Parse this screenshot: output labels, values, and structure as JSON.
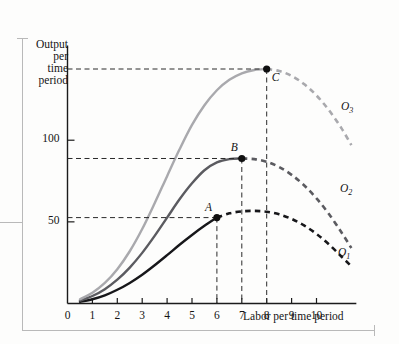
{
  "figure": {
    "y_axis_title_lines": [
      "Output",
      "per",
      "time",
      "period"
    ],
    "x_axis_title": "Labor per time period"
  },
  "chart_data": {
    "type": "line",
    "title": "",
    "xlabel": "Labor per time period",
    "ylabel": "Output per time period",
    "xlim": [
      0,
      11.6
    ],
    "ylim": [
      0,
      158
    ],
    "grid": false,
    "x_ticks": [
      0,
      1,
      2,
      3,
      4,
      5,
      6,
      7,
      8,
      9,
      10
    ],
    "x_tick_labels": [
      "0",
      "1",
      "2",
      "3",
      "4",
      "5",
      "6",
      "7",
      "8",
      "9",
      "10"
    ],
    "y_ticks": [
      50,
      100
    ],
    "y_tick_labels": [
      "50",
      "100"
    ],
    "series": [
      {
        "name": "O1",
        "label": "O₁",
        "color": "#17171a",
        "x": [
          0,
          0.5,
          1,
          1.5,
          2,
          2.5,
          3,
          3.5,
          4,
          4.5,
          5,
          5.5,
          6,
          6.5,
          7,
          7.5,
          8,
          8.5,
          9,
          9.5,
          10,
          10.5,
          11,
          11.4
        ],
        "values": [
          0,
          1.0,
          2.6,
          5.0,
          8.4,
          12.6,
          17.6,
          23.4,
          29.6,
          36.0,
          42.0,
          47.6,
          52.6,
          55.2,
          56.4,
          56.7,
          56.2,
          54.6,
          51.8,
          47.8,
          42.6,
          36.2,
          28.8,
          22.8
        ],
        "solid_until_x": 6,
        "dashed_after_x": 6
      },
      {
        "name": "O2",
        "label": "O₂",
        "color": "#5b5b60",
        "x": [
          0,
          0.5,
          1,
          1.5,
          2,
          2.5,
          3,
          3.5,
          4,
          4.5,
          5,
          5.5,
          6,
          6.5,
          7,
          7.5,
          8,
          8.5,
          9,
          9.5,
          10,
          10.5,
          11,
          11.4
        ],
        "values": [
          0,
          1.8,
          4.6,
          8.8,
          14.6,
          22.0,
          31.0,
          41.4,
          52.6,
          63.8,
          73.6,
          81.6,
          86.4,
          88.4,
          88.8,
          88.4,
          86.8,
          83.6,
          78.8,
          72.4,
          64.4,
          54.8,
          43.6,
          34.0
        ],
        "solid_until_x": 7,
        "dashed_after_x": 7
      },
      {
        "name": "O3",
        "label": "O₃",
        "color": "#a9a9ad",
        "x": [
          0,
          0.5,
          1,
          1.5,
          2,
          2.5,
          3,
          3.5,
          4,
          4.5,
          5,
          5.5,
          6,
          6.5,
          7,
          7.5,
          8,
          8.5,
          9,
          9.5,
          10,
          10.5,
          11,
          11.4
        ],
        "values": [
          0,
          2.6,
          6.6,
          12.6,
          21.0,
          32.0,
          45.6,
          61.4,
          78.0,
          94.4,
          109.4,
          121.4,
          130.6,
          137.0,
          141.0,
          143.0,
          143.6,
          142.4,
          139.4,
          134.4,
          127.4,
          118.4,
          107.4,
          97.0
        ],
        "solid_until_x": 8,
        "dashed_after_x": 8
      }
    ],
    "points": [
      {
        "label": "A",
        "x": 6,
        "y": 52.6,
        "series": "O1"
      },
      {
        "label": "B",
        "x": 7,
        "y": 88.8,
        "series": "O2"
      },
      {
        "label": "C",
        "x": 8,
        "y": 143.6,
        "series": "O3"
      }
    ],
    "annotations": {
      "h_guides": [
        {
          "from_point": "A",
          "y": 52.6
        },
        {
          "from_point": "B",
          "y": 88.8
        },
        {
          "from_point": "C",
          "y": 143.6
        }
      ],
      "v_guides": [
        {
          "from_point": "A",
          "x": 6
        },
        {
          "from_point": "B",
          "x": 7
        },
        {
          "from_point": "C",
          "x": 8
        }
      ]
    }
  }
}
